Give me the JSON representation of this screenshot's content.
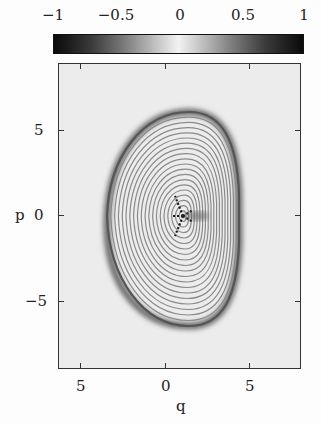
{
  "chart_data": {
    "type": "heatmap",
    "title": "",
    "xlabel": "q",
    "ylabel": "p",
    "xlim": [
      -6.3,
      8.0
    ],
    "ylim": [
      -9.0,
      8.9
    ],
    "x_ticks": [
      {
        "value": -5,
        "label": "5"
      },
      {
        "value": 0,
        "label": "0"
      },
      {
        "value": 5,
        "label": "5"
      }
    ],
    "y_ticks": [
      {
        "value": 5,
        "label": "5"
      },
      {
        "value": 0,
        "label": "0"
      },
      {
        "value": -5,
        "label": "−5"
      }
    ],
    "grid": false,
    "colorbar": {
      "position": "top",
      "range": [
        -1,
        1
      ],
      "ticks": [
        {
          "value": -1,
          "label": "−1"
        },
        {
          "value": -0.5,
          "label": "−0.5"
        },
        {
          "value": 0,
          "label": "0"
        },
        {
          "value": 0.5,
          "label": "0.5"
        },
        {
          "value": 1,
          "label": "1"
        }
      ],
      "colormap": "grayscale symmetric: black at ±1, white at 0"
    },
    "features": {
      "boundary_shape": "D-shaped closed curve, flatter on right side",
      "boundary_extent": {
        "q_min": -2.9,
        "q_max": 5.0,
        "p_min": -6.8,
        "p_max": 7.1
      },
      "center_feature": {
        "q": 1.0,
        "p": 0.0,
        "type": "star / fringe convergence"
      },
      "fringe_count_approx": 20
    }
  }
}
